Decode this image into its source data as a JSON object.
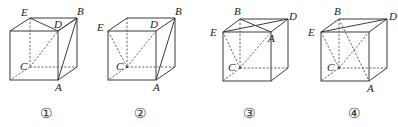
{
  "figures": [
    {
      "caption": "①",
      "labels": {
        "E": "E",
        "D": "D",
        "B": "B",
        "A": "A",
        "C": "C"
      },
      "description": "Cube with segments ED, DB, BA solid and CD dashed"
    },
    {
      "caption": "②",
      "labels": {
        "E": "E",
        "D": "D",
        "B": "B",
        "A": "A",
        "C": "C"
      },
      "description": "Cube with BA solid and CE, CD dashed"
    },
    {
      "caption": "③",
      "labels": {
        "B": "B",
        "D": "D",
        "E": "E",
        "A": "A",
        "C": "C"
      },
      "description": "Cube with EB, BD, ED, BA solid and CE, CA dashed"
    },
    {
      "caption": "④",
      "labels": {
        "B": "B",
        "D": "D",
        "E": "E",
        "A": "A",
        "C": "C"
      },
      "description": "Cube with EB, ED solid and CE, BA dashed"
    }
  ]
}
